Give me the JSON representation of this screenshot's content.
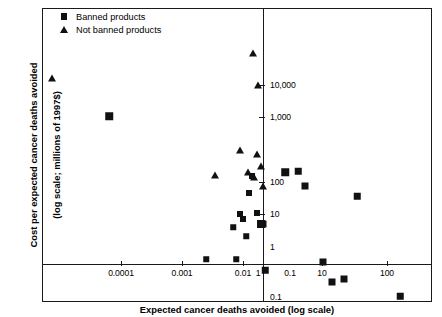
{
  "chart_data": {
    "type": "scatter",
    "title": "",
    "xlabel": "Expected cancer deaths avoided (log scale)",
    "ylabel_line1": "Cost per expected cancer deaths avoided",
    "ylabel_line2": "(log scale; millions of 1997$)",
    "xscale": "log",
    "yscale": "log",
    "xlim": [
      3e-05,
      300
    ],
    "ylim": [
      0.08,
      40000
    ],
    "grid": false,
    "legend_position": "top-left",
    "xticks": [
      {
        "value": "0.0001",
        "px": 121
      },
      {
        "value": "0.001",
        "px": 182
      },
      {
        "value": "0.01",
        "px": 243
      },
      {
        "value": "0.1",
        "px": 290
      },
      {
        "value": "1",
        "px": 258
      },
      {
        "value": "10",
        "px": 322
      },
      {
        "value": "100",
        "px": 387
      }
    ],
    "yticks": [
      {
        "value": "10,000",
        "px": 85
      },
      {
        "value": "1,000",
        "px": 117
      },
      {
        "value": "100",
        "px": 182
      },
      {
        "value": "10",
        "px": 214
      },
      {
        "value": "1",
        "px": 247
      },
      {
        "value": "0.1",
        "px": 297
      }
    ],
    "xtick_marks_px": [
      121,
      182,
      243,
      322,
      387
    ],
    "ytick_marks_px": [
      85,
      117,
      182,
      214
    ],
    "series": [
      {
        "name": "Banned products",
        "marker": "square",
        "color": "#111111",
        "points": [
          {
            "x": 0.0004,
            "y": 1700,
            "px": 109,
            "py": 116,
            "s": 7.5
          },
          {
            "x": 0.055,
            "y": 0.85,
            "px": 206,
            "py": 259,
            "s": 5.5
          },
          {
            "x": 0.16,
            "y": 4.5,
            "px": 233,
            "py": 227,
            "s": 5.5
          },
          {
            "x": 0.17,
            "y": 1.0,
            "px": 236,
            "py": 259,
            "s": 5.5
          },
          {
            "x": 0.2,
            "y": 12,
            "px": 240,
            "py": 214,
            "s": 6.0
          },
          {
            "x": 0.22,
            "y": 9.5,
            "px": 243,
            "py": 219,
            "s": 6.0
          },
          {
            "x": 0.24,
            "y": 3.0,
            "px": 246,
            "py": 236,
            "s": 5.5
          },
          {
            "x": 0.26,
            "y": 45,
            "px": 249,
            "py": 193,
            "s": 6.0
          },
          {
            "x": 0.3,
            "y": 130,
            "px": 252,
            "py": 176,
            "s": 6.0
          },
          {
            "x": 0.38,
            "y": 12,
            "px": 257,
            "py": 213,
            "s": 6.0
          },
          {
            "x": 0.45,
            "y": 6.0,
            "px": 261,
            "py": 224,
            "s": 8.0
          },
          {
            "x": 0.5,
            "y": 6.0,
            "px": 263,
            "py": 224,
            "s": 7.0
          },
          {
            "x": 0.55,
            "y": 0.55,
            "px": 265,
            "py": 270,
            "s": 6.5
          },
          {
            "x": 1.4,
            "y": 90,
            "px": 285,
            "py": 172,
            "s": 7.5
          },
          {
            "x": 2.6,
            "y": 95,
            "px": 298,
            "py": 171,
            "s": 6.5
          },
          {
            "x": 3.6,
            "y": 40,
            "px": 305,
            "py": 186,
            "s": 7.0
          },
          {
            "x": 7.0,
            "y": 1.0,
            "px": 323,
            "py": 262,
            "s": 7.0
          },
          {
            "x": 11,
            "y": 0.3,
            "px": 332,
            "py": 282,
            "s": 7.0
          },
          {
            "x": 17,
            "y": 0.35,
            "px": 344,
            "py": 279,
            "s": 7.0
          },
          {
            "x": 22,
            "y": 22,
            "px": 357,
            "py": 196,
            "s": 6.5
          },
          {
            "x": 150,
            "y": 0.13,
            "px": 400,
            "py": 296,
            "s": 6.5
          }
        ]
      },
      {
        "name": "Not banned products",
        "marker": "triangle",
        "color": "#111111",
        "points": [
          {
            "x": 6e-05,
            "y": 5000,
            "px": 52,
            "py": 78,
            "s": 7.5
          },
          {
            "x": 0.012,
            "y": 110,
            "px": 215,
            "py": 175,
            "s": 7.5
          },
          {
            "x": 0.13,
            "y": 16000,
            "px": 253,
            "py": 53,
            "s": 7.5
          },
          {
            "x": 0.17,
            "y": 4000,
            "px": 258,
            "py": 85,
            "s": 7.5
          },
          {
            "x": 0.19,
            "y": 380,
            "px": 240,
            "py": 150,
            "s": 7.0
          },
          {
            "x": 0.22,
            "y": 330,
            "px": 257,
            "py": 154,
            "s": 7.0
          },
          {
            "x": 0.26,
            "y": 145,
            "px": 248,
            "py": 172,
            "s": 7.0
          },
          {
            "x": 0.31,
            "y": 125,
            "px": 254,
            "py": 177,
            "s": 7.0
          },
          {
            "x": 0.4,
            "y": 190,
            "px": 261,
            "py": 166,
            "s": 7.0
          },
          {
            "x": 0.5,
            "y": 80,
            "px": 263,
            "py": 186,
            "s": 7.5
          }
        ]
      }
    ]
  },
  "legend": {
    "items": [
      {
        "label": "Banned products",
        "marker": "square"
      },
      {
        "label": "Not banned products",
        "marker": "triangle"
      }
    ]
  }
}
